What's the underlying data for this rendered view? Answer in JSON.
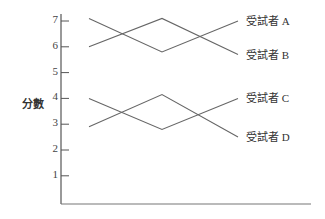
{
  "chart_data": {
    "type": "line",
    "title": "",
    "xlabel": "",
    "ylabel": "分數",
    "ylim": [
      0,
      7.4
    ],
    "yticks": [
      1,
      2,
      3,
      4,
      5,
      6,
      7
    ],
    "grid": false,
    "x": [
      1,
      2,
      3
    ],
    "series": [
      {
        "name": "受試者 A",
        "values": [
          7.1,
          5.8,
          7.0
        ]
      },
      {
        "name": "受試者 B",
        "values": [
          6.0,
          7.1,
          5.7
        ]
      },
      {
        "name": "受試者 C",
        "values": [
          4.0,
          2.8,
          4.0
        ]
      },
      {
        "name": "受試者 D",
        "values": [
          2.9,
          4.15,
          2.5
        ]
      }
    ],
    "legend_position": "right, inline at line ends"
  }
}
